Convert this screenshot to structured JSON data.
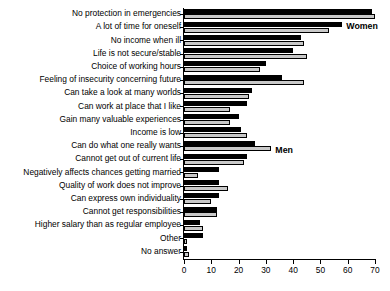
{
  "chart_data": {
    "type": "bar",
    "orientation": "horizontal",
    "title": "",
    "xlabel": "",
    "ylabel": "",
    "xlim": [
      0,
      70
    ],
    "xticks": [
      0,
      10,
      20,
      30,
      40,
      50,
      60,
      70
    ],
    "grid": false,
    "legend": {
      "position": "inside-right",
      "entries": [
        {
          "name": "Women",
          "color": "#000000"
        },
        {
          "name": "Men",
          "color": "#c9c9c9"
        }
      ]
    },
    "categories": [
      "No protection in emergencies",
      "A lot of time for oneself",
      "No income when ill",
      "Life is not secure/stable",
      "Choice of working hours",
      "Feeling of insecurity concerning future",
      "Can take a look at many worlds",
      "Can work at place that I like",
      "Gain many valuable experiences",
      "Income is low",
      "Can do what one really wants",
      "Cannot get out of current life",
      "Negatively affects chances getting married",
      "Quality of work does not improve",
      "Can express own individuality",
      "Cannot get responsibilities",
      "Higher salary than as regular employee",
      "Other",
      "No answer"
    ],
    "series": [
      {
        "name": "Women",
        "color": "#000000",
        "values": [
          69,
          58,
          43,
          40,
          30,
          36,
          25,
          23,
          20,
          21,
          26,
          23,
          13,
          13,
          13,
          12,
          6,
          7,
          1
        ]
      },
      {
        "name": "Men",
        "color": "#c9c9c9",
        "values": [
          70,
          53,
          44,
          45,
          28,
          44,
          24,
          17,
          17,
          23,
          32,
          22,
          5,
          16,
          10,
          12,
          7,
          1,
          2
        ]
      }
    ]
  }
}
